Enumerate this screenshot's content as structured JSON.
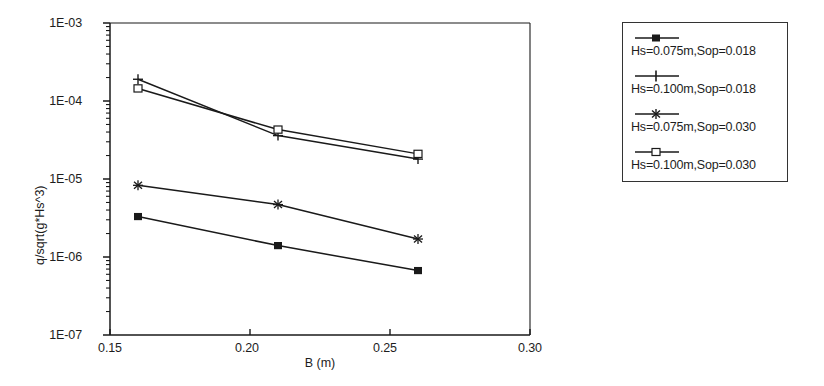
{
  "chart_data": {
    "type": "line",
    "title": "",
    "xlabel": "B (m)",
    "ylabel": "q/sqrt(g*Hs^3)",
    "x": [
      0.16,
      0.21,
      0.26
    ],
    "xlim": [
      0.15,
      0.3
    ],
    "ylim": [
      1e-07,
      0.001
    ],
    "yscale": "log",
    "grid": false,
    "legend_position": "right-outside",
    "xticks": [
      "0.15",
      "0.20",
      "0.25",
      "0.30"
    ],
    "xtick_values": [
      0.15,
      0.2,
      0.25,
      0.3
    ],
    "yticks": [
      "1E-03",
      "1E-04",
      "1E-05",
      "1E-06",
      "1E-07"
    ],
    "ytick_values": [
      0.001,
      0.0001,
      1e-05,
      1e-06,
      1e-07
    ],
    "series": [
      {
        "name": "Hs=0.075m,Sop=0.018",
        "marker": "filled-square",
        "values": [
          3.3e-06,
          1.4e-06,
          6.7e-07
        ]
      },
      {
        "name": "Hs=0.100m,Sop=0.018",
        "marker": "plus",
        "values": [
          0.00019,
          3.6e-05,
          1.8e-05
        ]
      },
      {
        "name": "Hs=0.075m,Sop=0.030",
        "marker": "asterisk",
        "values": [
          8.3e-06,
          4.7e-06,
          1.7e-06
        ]
      },
      {
        "name": "Hs=0.100m,Sop=0.030",
        "marker": "open-square",
        "values": [
          0.000145,
          4.3e-05,
          2.1e-05
        ]
      }
    ]
  },
  "axes": {
    "x_tick_0": "0.15",
    "x_tick_1": "0.20",
    "x_tick_2": "0.25",
    "x_tick_3": "0.30",
    "y_tick_0": "1E-03",
    "y_tick_1": "1E-04",
    "y_tick_2": "1E-05",
    "y_tick_3": "1E-06",
    "y_tick_4": "1E-07",
    "x_axis_title": "B (m)",
    "y_axis_title": "q/sqrt(g*Hs^3)"
  },
  "legend": {
    "entries": [
      {
        "label": "Hs=0.075m,Sop=0.018",
        "marker": "filled-square"
      },
      {
        "label": "Hs=0.100m,Sop=0.018",
        "marker": "plus"
      },
      {
        "label": "Hs=0.075m,Sop=0.030",
        "marker": "asterisk"
      },
      {
        "label": "Hs=0.100m,Sop=0.030",
        "marker": "open-square"
      }
    ]
  },
  "colors": {
    "line": "#1a1a1a",
    "axis": "#1d1d1d",
    "background": "#ffffff"
  }
}
